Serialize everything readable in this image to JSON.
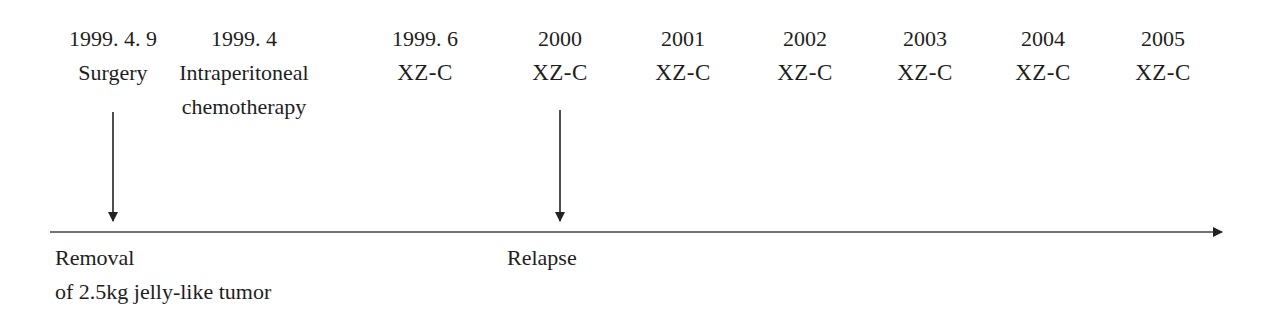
{
  "timeline": {
    "columns": [
      {
        "date": "1999. 4. 9",
        "event": "Surgery",
        "x": 113
      },
      {
        "date": "1999. 4",
        "event": "Intraperitoneal",
        "event_line2": "chemotherapy",
        "x": 244
      },
      {
        "date": "1999. 6",
        "event": "XZ-C",
        "x": 425
      },
      {
        "date": "2000",
        "event": "XZ-C",
        "x": 560
      },
      {
        "date": "2001",
        "event": "XZ-C",
        "x": 683
      },
      {
        "date": "2002",
        "event": "XZ-C",
        "x": 805
      },
      {
        "date": "2003",
        "event": "XZ-C",
        "x": 925
      },
      {
        "date": "2004",
        "event": "XZ-C",
        "x": 1043
      },
      {
        "date": "2005",
        "event": "XZ-C",
        "x": 1163
      }
    ],
    "annotations": [
      {
        "line1": "Removal",
        "line2": "of 2.5kg jelly-like tumor",
        "x": 55
      },
      {
        "line1": "Relapse",
        "x": 507
      }
    ],
    "axis_color": "#333333"
  }
}
